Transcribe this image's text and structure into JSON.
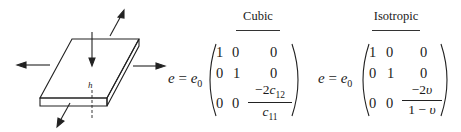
{
  "figure": {
    "slab_diagram": {
      "thickness_label": "h"
    },
    "cases": [
      {
        "heading": "Cubic",
        "lhs": {
          "var": "e",
          "eq": "=",
          "coef": "e",
          "coef_sub": "0"
        },
        "matrix": {
          "rows": [
            [
              "1",
              "0",
              "0"
            ],
            [
              "0",
              "1",
              "0"
            ],
            [
              "0",
              "0",
              null
            ]
          ],
          "fraction": {
            "numerator_prefix": "−2",
            "numerator_var": "c",
            "numerator_sub": "12",
            "denominator_var": "c",
            "denominator_sub": "11"
          }
        }
      },
      {
        "heading": "Isotropic",
        "lhs": {
          "var": "e",
          "eq": "=",
          "coef": "e",
          "coef_sub": "0"
        },
        "matrix": {
          "rows": [
            [
              "1",
              "0",
              "0"
            ],
            [
              "0",
              "1",
              "0"
            ],
            [
              "0",
              "0",
              null
            ]
          ],
          "fraction": {
            "numerator_prefix": "−2",
            "numerator_var": "υ",
            "denominator_prefix": "1 − ",
            "denominator_var": "υ"
          }
        }
      }
    ]
  }
}
